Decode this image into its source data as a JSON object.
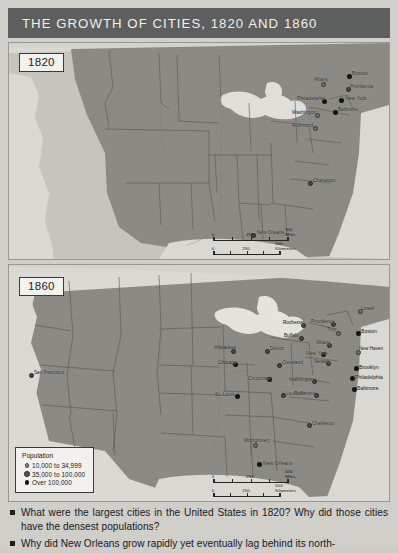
{
  "header": {
    "title": "THE GROWTH OF CITIES, 1820 AND 1860"
  },
  "maps": [
    {
      "id": "map-1820",
      "year_label": "1820",
      "scale": {
        "miles": {
          "ticks": [
            "0",
            "250",
            "500 Miles"
          ]
        },
        "kilometers": {
          "ticks": [
            "0",
            "250",
            "500 Kilometers"
          ]
        }
      },
      "cities": [
        {
          "name": "Boston",
          "size": 3,
          "x": 349,
          "y": 75
        },
        {
          "name": "Providence",
          "size": 2,
          "x": 345,
          "y": 88
        },
        {
          "name": "Albany",
          "size": 1,
          "x": 318,
          "y": 84
        },
        {
          "name": "New York",
          "size": 3,
          "x": 339,
          "y": 99
        },
        {
          "name": "Philadelphia",
          "size": 3,
          "x": 316,
          "y": 100
        },
        {
          "name": "Baltimore",
          "size": 3,
          "x": 333,
          "y": 111
        },
        {
          "name": "Washington",
          "size": 1,
          "x": 316,
          "y": 113
        },
        {
          "name": "Richmond",
          "size": 1,
          "x": 316,
          "y": 126
        },
        {
          "name": "Charleston",
          "size": 2,
          "x": 330,
          "y": 180
        },
        {
          "name": "New Orleans",
          "size": 2,
          "x": 258,
          "y": 232
        }
      ]
    },
    {
      "id": "map-1860",
      "year_label": "1860",
      "scale": {
        "miles": {
          "ticks": [
            "0",
            "250",
            "500 Miles"
          ]
        },
        "kilometers": {
          "ticks": [
            "0",
            "250",
            "500 Kilometers"
          ]
        }
      },
      "legend": {
        "title": "Population",
        "items": [
          {
            "label": "10,000 to 34,999",
            "size": 1
          },
          {
            "label": "35,000 to 100,000",
            "size": 2
          },
          {
            "label": "Over 100,000",
            "size": 3
          }
        ]
      },
      "cities": [
        {
          "name": "San Francisco",
          "size": 2,
          "x": 28,
          "y": 375
        },
        {
          "name": "Milwaukee",
          "size": 2,
          "x": 235,
          "y": 353
        },
        {
          "name": "Chicago",
          "size": 3,
          "x": 240,
          "y": 365
        },
        {
          "name": "Detroit",
          "size": 2,
          "x": 271,
          "y": 352
        },
        {
          "name": "Cleveland",
          "size": 2,
          "x": 283,
          "y": 366
        },
        {
          "name": "Cincinnati",
          "size": 3,
          "x": 268,
          "y": 380
        },
        {
          "name": "St. Louis",
          "size": 3,
          "x": 237,
          "y": 396
        },
        {
          "name": "Louisville",
          "size": 2,
          "x": 282,
          "y": 396
        },
        {
          "name": "Rochester",
          "size": 2,
          "x": 305,
          "y": 326
        },
        {
          "name": "Buffalo",
          "size": 2,
          "x": 303,
          "y": 339
        },
        {
          "name": "Lowell",
          "size": 1,
          "x": 362,
          "y": 312
        },
        {
          "name": "Providence",
          "size": 2,
          "x": 336,
          "y": 325
        },
        {
          "name": "Boston",
          "size": 3,
          "x": 360,
          "y": 334
        },
        {
          "name": "Troy",
          "size": 1,
          "x": 340,
          "y": 334
        },
        {
          "name": "Albany",
          "size": 2,
          "x": 331,
          "y": 345
        },
        {
          "name": "New York",
          "size": 3,
          "x": 325,
          "y": 354
        },
        {
          "name": "Newark",
          "size": 2,
          "x": 330,
          "y": 363
        },
        {
          "name": "New Haven",
          "size": 1,
          "x": 362,
          "y": 352
        },
        {
          "name": "Brooklyn",
          "size": 3,
          "x": 359,
          "y": 369
        },
        {
          "name": "Philadelphia",
          "size": 3,
          "x": 356,
          "y": 379
        },
        {
          "name": "Baltimore",
          "size": 3,
          "x": 358,
          "y": 390
        },
        {
          "name": "Washington",
          "size": 2,
          "x": 315,
          "y": 382
        },
        {
          "name": "Richmond",
          "size": 2,
          "x": 318,
          "y": 396
        },
        {
          "name": "Charleston",
          "size": 2,
          "x": 330,
          "y": 426
        },
        {
          "name": "Montgomery",
          "size": 1,
          "x": 262,
          "y": 444
        },
        {
          "name": "New Orleans",
          "size": 3,
          "x": 265,
          "y": 465
        }
      ]
    }
  ],
  "questions": [
    "What were the largest cities in the United States in 1820? Why did those cities have the densest populations?",
    "Why did New Orleans grow rapidly yet eventually lag behind its north-"
  ],
  "colors": {
    "title_bar": "#5d5f5e",
    "title_text": "#f2f1ee",
    "land_settled": "#8b8a84",
    "land_unsettled": "#c7c5c0",
    "water": "#dedcd7",
    "page_bg": "#d2d0cb"
  }
}
